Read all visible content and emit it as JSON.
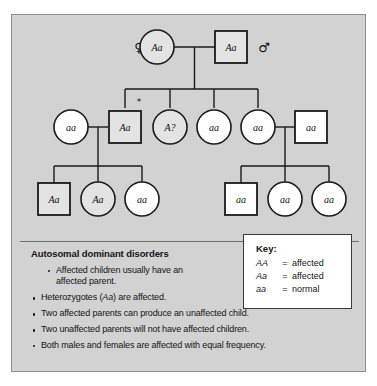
{
  "figure": {
    "background_color": "#d2d2d2",
    "border_color": "#8e8e8e"
  },
  "pedigree": {
    "title": "Autosomal dominant pedigree",
    "female_symbol": "♀",
    "male_symbol": "♂",
    "proband_marker": "*",
    "colors": {
      "affected_fill": "#e3e3e3",
      "normal_fill": "#ffffff",
      "outline": "#1a1a1a",
      "line": "#1a1a1a"
    },
    "generations": [
      {
        "id": "generation-1",
        "individuals": [
          {
            "id": "g1-mother",
            "shape": "circle",
            "sex": "female",
            "genotype": "Aa",
            "status": "affected"
          },
          {
            "id": "g1-father",
            "shape": "square",
            "sex": "male",
            "genotype": "Aa",
            "status": "affected"
          }
        ]
      },
      {
        "id": "generation-2",
        "individuals": [
          {
            "id": "g2-spouse-left",
            "shape": "circle",
            "sex": "female",
            "genotype": "aa",
            "status": "normal"
          },
          {
            "id": "g2-child-1",
            "shape": "square",
            "sex": "male",
            "genotype": "Aa",
            "status": "affected",
            "marked": true
          },
          {
            "id": "g2-child-2",
            "shape": "circle",
            "sex": "female",
            "genotype": "A?",
            "status": "affected"
          },
          {
            "id": "g2-child-3",
            "shape": "circle",
            "sex": "female",
            "genotype": "aa",
            "status": "normal"
          },
          {
            "id": "g2-child-4",
            "shape": "circle",
            "sex": "female",
            "genotype": "aa",
            "status": "normal"
          },
          {
            "id": "g2-spouse-right",
            "shape": "square",
            "sex": "male",
            "genotype": "aa",
            "status": "normal"
          }
        ]
      },
      {
        "id": "generation-3",
        "individuals": [
          {
            "id": "g3-left-1",
            "shape": "square",
            "sex": "male",
            "genotype": "Aa",
            "status": "affected"
          },
          {
            "id": "g3-left-2",
            "shape": "circle",
            "sex": "female",
            "genotype": "Aa",
            "status": "affected"
          },
          {
            "id": "g3-left-3",
            "shape": "circle",
            "sex": "female",
            "genotype": "aa",
            "status": "normal"
          },
          {
            "id": "g3-right-1",
            "shape": "square",
            "sex": "male",
            "genotype": "aa",
            "status": "normal"
          },
          {
            "id": "g3-right-2",
            "shape": "circle",
            "sex": "female",
            "genotype": "aa",
            "status": "normal"
          },
          {
            "id": "g3-right-3",
            "shape": "circle",
            "sex": "female",
            "genotype": "aa",
            "status": "normal"
          }
        ]
      }
    ]
  },
  "info": {
    "title": "Autosomal dominant disorders",
    "bullets": [
      {
        "text": "Affected children usually have an",
        "text2": "affected parent.",
        "indented": true,
        "italic_part": ""
      },
      {
        "pre": "Heterozygotes (",
        "italic": "Aa",
        "post": ") are affected.",
        "indented": false
      },
      {
        "text": "Two affected parents can produce an unaffected child.",
        "indented": false
      },
      {
        "text": "Two unaffected parents will not have affected children.",
        "indented": false
      },
      {
        "text": "Both males and females are affected with equal frequency.",
        "indented": false
      }
    ]
  },
  "key": {
    "title": "Key:",
    "equals": "=",
    "rows": [
      {
        "genotype": "AA",
        "meaning": "affected"
      },
      {
        "genotype": "Aa",
        "meaning": "affected"
      },
      {
        "genotype": "aa",
        "meaning": "normal"
      }
    ]
  }
}
